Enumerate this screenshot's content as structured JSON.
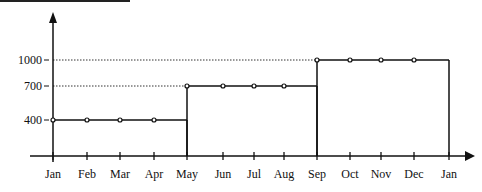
{
  "chart_data": {
    "type": "line",
    "subtype": "step",
    "title": "",
    "xlabel": "",
    "ylabel": "",
    "categories": [
      "Jan",
      "Feb",
      "Mar",
      "Apr",
      "May",
      "Jun",
      "Jul",
      "Aug",
      "Sep",
      "Oct",
      "Nov",
      "Dec",
      "Jan"
    ],
    "series": [
      {
        "name": "level",
        "values": [
          400,
          400,
          400,
          400,
          700,
          700,
          700,
          700,
          1000,
          1000,
          1000,
          1000,
          null
        ]
      }
    ],
    "y_ticks": [
      400,
      700,
      1000
    ],
    "y_tick_labels": [
      "400",
      "700",
      "1000"
    ],
    "reference_lines": [
      {
        "value": 1000,
        "style": "dotted"
      },
      {
        "value": 700,
        "style": "dotted"
      }
    ],
    "steps": [
      {
        "from": "Jan",
        "to": "May",
        "value": 400
      },
      {
        "from": "May",
        "to": "Sep",
        "value": 700
      },
      {
        "from": "Sep",
        "to": "Jan",
        "value": 1000
      }
    ],
    "grid": false,
    "legend": "none",
    "colors": {
      "line": "#111111",
      "background": "#ffffff"
    }
  }
}
